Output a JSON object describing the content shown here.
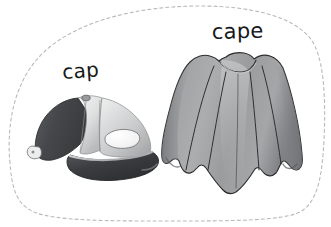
{
  "card": {
    "width": 331,
    "height": 227,
    "background_color": "#ffffff",
    "border": {
      "name": "dashed-blob-border",
      "style": "dashed",
      "color": "#b9b9bb",
      "stroke_width": 1.1,
      "dash_pattern": "3 3"
    }
  },
  "items": [
    {
      "id": "cap",
      "label": "cap",
      "illustration": "baseball-cap",
      "colors": {
        "dark_panel": "#4a4a4c",
        "mid_panel": "#6f7073",
        "light_panel": "#d8d9da",
        "highlight": "#f2f3f3",
        "brim_dark": "#3e3f41",
        "outline": "#2e2f31"
      }
    },
    {
      "id": "cape",
      "label": "cape",
      "illustration": "draped-cape",
      "colors": {
        "body": "#9a9a9c",
        "shade": "#7e7f82",
        "highlight": "#c3c4c6",
        "fold_line": "#2f3032",
        "outline": "#2b2c2e"
      }
    }
  ]
}
